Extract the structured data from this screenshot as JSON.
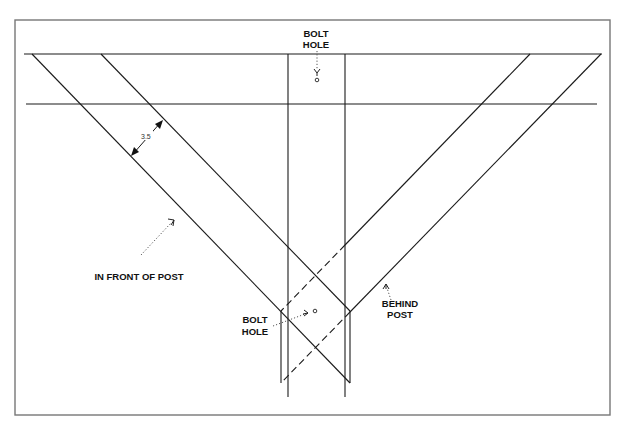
{
  "diagram": {
    "labels": {
      "bolt_hole_top_line1": "BOLT",
      "bolt_hole_top_line2": "HOLE",
      "bolt_hole_bottom_line1": "BOLT",
      "bolt_hole_bottom_line2": "HOLE",
      "in_front_of_post": "IN FRONT OF POST",
      "behind_post_line1": "BEHIND",
      "behind_post_line2": "POST",
      "dimension": "3.5"
    },
    "components": [
      {
        "name": "post",
        "style": "solid"
      },
      {
        "name": "beam",
        "style": "solid"
      },
      {
        "name": "left-brace",
        "position": "in front of post",
        "style": "solid"
      },
      {
        "name": "right-brace",
        "position": "behind post",
        "style": "dashed where hidden"
      }
    ],
    "colors": {
      "line": "#1a1a1a",
      "border": "#777777",
      "background": "#ffffff"
    }
  }
}
